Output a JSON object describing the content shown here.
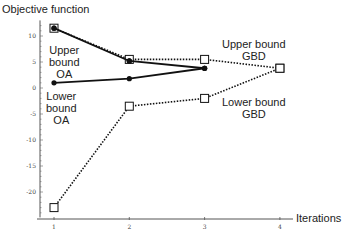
{
  "chart_data": {
    "type": "line",
    "title": "",
    "ylabel": "Objective function",
    "xlabel": "Iterations",
    "x": [
      1,
      2,
      3,
      4
    ],
    "xticks": [
      "1",
      "2",
      "3",
      "4"
    ],
    "yticks": [
      "10",
      "5",
      "0",
      "-5",
      "-10",
      "-15",
      "-20"
    ],
    "ylim": [
      -24.5,
      13
    ],
    "xlim": [
      0.8,
      4.2
    ],
    "grid": false,
    "series": [
      {
        "name": "Upper bound OA",
        "style": "solid",
        "marker": "filled-circle",
        "x": [
          1,
          2,
          3
        ],
        "values": [
          11.5,
          5.2,
          3.8
        ]
      },
      {
        "name": "Lower bound OA",
        "style": "solid",
        "marker": "filled-circle",
        "x": [
          1,
          2,
          3
        ],
        "values": [
          1.0,
          1.8,
          3.8
        ]
      },
      {
        "name": "Upper bound GBD",
        "style": "dotted",
        "marker": "open-square",
        "x": [
          1,
          2,
          3,
          4
        ],
        "values": [
          11.5,
          5.5,
          5.5,
          3.8
        ]
      },
      {
        "name": "Lower bound GBD",
        "style": "dotted",
        "marker": "open-square",
        "x": [
          1,
          2,
          3,
          4
        ],
        "values": [
          -23.0,
          -3.5,
          -2.0,
          3.8
        ]
      }
    ],
    "annotations": [
      {
        "text": "Upper bound OA",
        "lines": [
          "Upper",
          "bound",
          "OA"
        ]
      },
      {
        "text": "Lower bound OA",
        "lines": [
          "Lower",
          "bound",
          "OA"
        ]
      },
      {
        "text": "Upper bound GBD",
        "lines": [
          "Upper bound",
          "GBD"
        ]
      },
      {
        "text": "Lower bound GBD",
        "lines": [
          "Lower bound",
          "GBD"
        ]
      }
    ]
  }
}
